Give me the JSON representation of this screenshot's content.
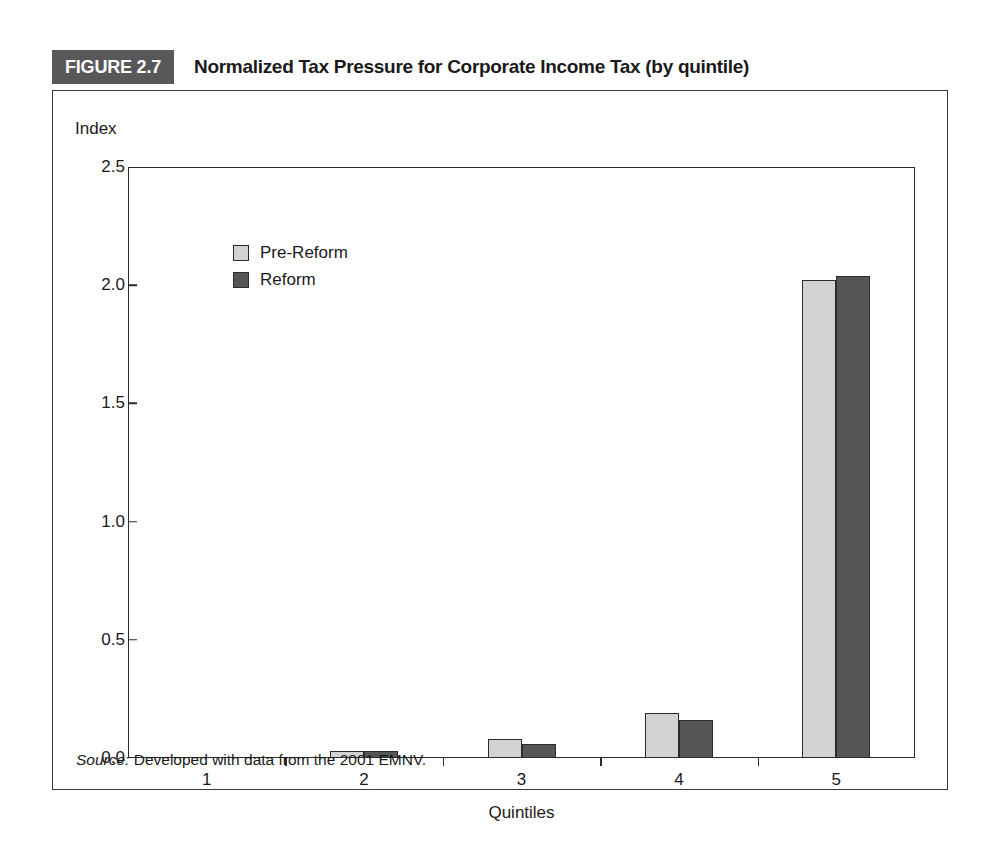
{
  "figure": {
    "tag": "FIGURE 2.7",
    "title": "Normalized Tax Pressure for Corporate Income Tax (by quintile)",
    "tag_background": "#58585a",
    "source_prefix": "Source:",
    "source_text": " Developed with data from the 2001 EMNV."
  },
  "chart_data": {
    "type": "bar",
    "title": "Normalized Tax Pressure for Corporate Income Tax (by quintile)",
    "xlabel": "Quintiles",
    "ylabel": "Index",
    "categories": [
      "1",
      "2",
      "3",
      "4",
      "5"
    ],
    "series": [
      {
        "name": "Pre-Reform",
        "color": "#d2d2d2",
        "values": [
          0.0,
          0.03,
          0.08,
          0.19,
          2.02
        ]
      },
      {
        "name": "Reform",
        "color": "#565656",
        "values": [
          0.0,
          0.03,
          0.06,
          0.16,
          2.04
        ]
      }
    ],
    "ylim": [
      0.0,
      2.5
    ],
    "yticks": [
      "0.0",
      "0.5",
      "1.0",
      "1.5",
      "2.0",
      "2.5"
    ],
    "ytick_values": [
      0.0,
      0.5,
      1.0,
      1.5,
      2.0,
      2.5
    ],
    "grid": false,
    "legend_position": "upper-left-inside"
  }
}
